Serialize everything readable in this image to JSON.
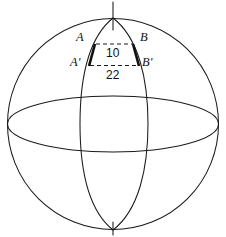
{
  "figure": {
    "type": "geometry-diagram",
    "background_color": "#ffffff",
    "stroke_color": "#1a1a1a",
    "bold_stroke_color": "#111111",
    "width": 226,
    "height": 237,
    "labels": {
      "a": "A",
      "b": "B",
      "a_prime": "A'",
      "b_prime": "B'"
    },
    "measurements": {
      "top_segment": "10",
      "bottom_segment": "22"
    },
    "parts": {
      "sphere_outline": "sphere-outline-circle",
      "equator": "equator-ellipse",
      "meridian_left": "meridian-left-arc",
      "meridian_right": "meridian-right-arc",
      "axis_top": "polar-axis-top",
      "axis_bottom": "polar-axis-bottom",
      "segment_aa_prime": "bold-segment-a-to-a-prime",
      "segment_bb_prime": "bold-segment-b-to-b-prime",
      "dashed_ab": "dashed-chord-ab",
      "dashed_ab_prime": "dashed-chord-a-prime-b-prime"
    },
    "geometry": {
      "circle_center_x": 113,
      "circle_center_y": 124,
      "circle_radius": 106,
      "equator_ry": 28,
      "pole_top_y": 18,
      "pole_bottom_y": 230,
      "meridian_half_width": 33,
      "a_x": 95,
      "a_y": 44,
      "b_x": 134,
      "b_y": 44,
      "a_prime_x": 89,
      "a_prime_y": 65,
      "b_prime_x": 139,
      "b_prime_y": 65
    }
  }
}
